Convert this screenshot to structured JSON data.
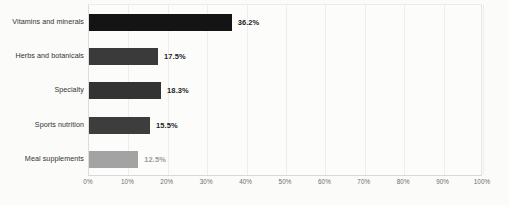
{
  "chart_data": {
    "type": "bar",
    "orientation": "horizontal",
    "title": "",
    "subtitle": "",
    "xlabel": "",
    "ylabel": "",
    "categories": [
      "Vitamins and minerals",
      "Herbs and botanicals",
      "Specialty",
      "Sports nutrition",
      "Meal supplements"
    ],
    "values": [
      36.2,
      17.5,
      18.3,
      15.5,
      12.5
    ],
    "value_labels": [
      "36.2%",
      "17.5%",
      "18.3%",
      "15.5%",
      "12.5%"
    ],
    "bar_colors": [
      "#141414",
      "#3a3a3a",
      "#333333",
      "#3d3d3d",
      "#a3a3a3"
    ],
    "value_label_colors": [
      "#1d1d1d",
      "#242424",
      "#242424",
      "#242424",
      "#9a9a9a"
    ],
    "xlim": [
      0,
      100
    ],
    "xticks": [
      0,
      10,
      20,
      30,
      40,
      50,
      60,
      70,
      80,
      90,
      100
    ],
    "xtick_labels": [
      "0%",
      "10%",
      "20%",
      "30%",
      "40%",
      "50%",
      "60%",
      "70%",
      "80%",
      "90%",
      "100%"
    ],
    "grid": true,
    "grid_axis": "x",
    "legend": false,
    "legend_position": "none"
  }
}
